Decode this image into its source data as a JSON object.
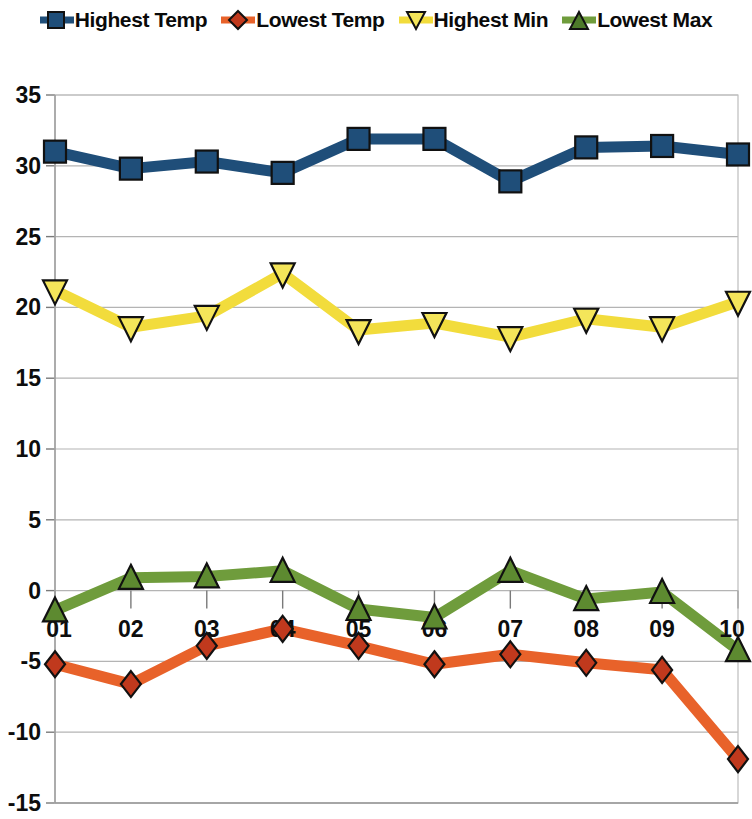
{
  "legend": {
    "position": "top",
    "entries": [
      {
        "label": "Highest Temp",
        "color": "#1f4e79",
        "marker": "square",
        "marker_icon": "square-marker-icon"
      },
      {
        "label": "Lowest Temp",
        "color": "#e8622a",
        "marker": "diamond",
        "marker_icon": "diamond-marker-icon"
      },
      {
        "label": "Highest Min",
        "color": "#f2dc3c",
        "marker": "triangle-down",
        "marker_icon": "triangle-down-marker-icon"
      },
      {
        "label": "Lowest Max",
        "color": "#6f9c3c",
        "marker": "triangle-up",
        "marker_icon": "triangle-up-marker-icon"
      }
    ]
  },
  "chart_data": {
    "type": "line",
    "title": "",
    "subtitle": "",
    "xlabel": "",
    "ylabel": "",
    "grid": true,
    "legend_position": "top",
    "categories": [
      "01",
      "02",
      "03",
      "04",
      "05",
      "06",
      "07",
      "08",
      "09",
      "10"
    ],
    "x": [
      "01",
      "02",
      "03",
      "04",
      "05",
      "06",
      "07",
      "08",
      "09",
      "10"
    ],
    "ylim": [
      -15,
      35
    ],
    "yticks": [
      35,
      30,
      25,
      20,
      15,
      10,
      5,
      0,
      -5,
      -10,
      -15
    ],
    "ytick_labels": [
      "35",
      "30",
      "25",
      "20",
      "15",
      "10",
      "5",
      "0",
      "-5",
      "-10",
      "-15"
    ],
    "xtick_labels": [
      "01",
      "02",
      "03",
      "04",
      "05",
      "06",
      "07",
      "08",
      "09",
      "10"
    ],
    "series": [
      {
        "name": "Highest Temp",
        "color": "#1f4e79",
        "marker": "square",
        "values": [
          31.0,
          29.8,
          30.3,
          29.5,
          31.9,
          31.9,
          28.9,
          31.3,
          31.4,
          30.8
        ]
      },
      {
        "name": "Lowest Temp",
        "color": "#e8622a",
        "marker": "diamond",
        "values": [
          -5.2,
          -6.6,
          -3.9,
          -2.7,
          -3.9,
          -5.2,
          -4.5,
          -5.1,
          -5.6,
          -11.9
        ]
      },
      {
        "name": "Highest Min",
        "color": "#f2dc3c",
        "marker": "triangle-down",
        "values": [
          21.2,
          18.6,
          19.4,
          22.4,
          18.4,
          18.9,
          17.9,
          19.2,
          18.6,
          20.4
        ]
      },
      {
        "name": "Lowest Max",
        "color": "#6f9c3c",
        "marker": "triangle-up",
        "values": [
          -1.4,
          0.9,
          1.0,
          1.4,
          -1.3,
          -1.9,
          1.4,
          -0.6,
          -0.1,
          -4.2
        ]
      }
    ]
  },
  "plot_geometry": {
    "left": 55,
    "right": 738,
    "top": 55,
    "bottom": 763,
    "x_label_y": 597
  }
}
